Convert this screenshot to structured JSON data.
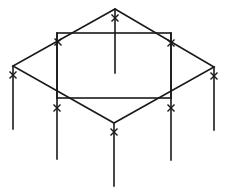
{
  "diagram": {
    "type": "isometric-frame-structure",
    "stroke_color": "#1a1a1a",
    "background": "#ffffff",
    "diamond": {
      "top": [
        115,
        9
      ],
      "right": [
        214,
        67
      ],
      "bottom": [
        114,
        123
      ],
      "left": [
        13,
        66
      ]
    },
    "rectangle": {
      "x1": 57,
      "y1": 33,
      "x2": 171,
      "y2": 98
    },
    "posts": [
      {
        "name": "center-post",
        "x": 115,
        "y1": 9,
        "y2": 73
      },
      {
        "name": "left-post",
        "x": 13,
        "y1": 66,
        "y2": 129
      },
      {
        "name": "right-post",
        "x": 214,
        "y1": 67,
        "y2": 130
      },
      {
        "name": "rect-left-post",
        "x": 57,
        "y1": 33,
        "y2": 159
      },
      {
        "name": "rect-right-post",
        "x": 171,
        "y1": 33,
        "y2": 160
      },
      {
        "name": "bottom-post",
        "x": 114,
        "y1": 123,
        "y2": 186
      }
    ],
    "x_marks": [
      [
        115,
        18
      ],
      [
        58,
        42
      ],
      [
        171,
        43
      ],
      [
        13,
        75
      ],
      [
        214,
        76
      ],
      [
        57,
        108
      ],
      [
        171,
        108
      ],
      [
        114,
        132
      ]
    ]
  }
}
